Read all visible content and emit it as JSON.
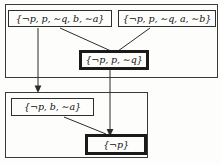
{
  "diagram": {
    "groups": [
      {
        "id": "group-top",
        "label": "upper-clause-group"
      },
      {
        "id": "group-bottom",
        "label": "lower-clause-group"
      }
    ],
    "nodes": {
      "clause_a": "{¬p, p, ∼q, b, ∼a}",
      "clause_b": "{¬p, p, ∼q, a, ∼b}",
      "clause_c": "{¬p, p, ∼q}",
      "clause_d": "{¬p, b, ∼a}",
      "clause_e": "{¬p}"
    },
    "edges": [
      {
        "from": "clause_a",
        "to": "clause_c",
        "style": "diagonal-plain"
      },
      {
        "from": "clause_b",
        "to": "clause_c",
        "style": "diagonal-plain"
      },
      {
        "from": "clause_a",
        "to": "group-bottom",
        "style": "vertical-arrow"
      },
      {
        "from": "clause_c",
        "to": "clause_e",
        "style": "vertical-arrow"
      },
      {
        "from": "clause_d",
        "to": "clause_e",
        "style": "diagonal-plain"
      }
    ],
    "colors": {
      "line": "#2b2b2b",
      "box_border": "#2e2e2e",
      "background": "#fdfdfb",
      "text": "#111111"
    }
  }
}
